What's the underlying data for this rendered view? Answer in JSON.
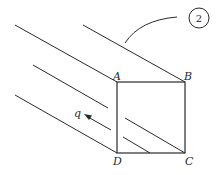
{
  "diagram": {
    "vertices": {
      "A": "A",
      "B": "B",
      "C": "C",
      "D": "D"
    },
    "flow_label": "q",
    "callout_number": "2",
    "colors": {
      "stroke": "#2a2a2a",
      "background": "#ffffff"
    }
  }
}
